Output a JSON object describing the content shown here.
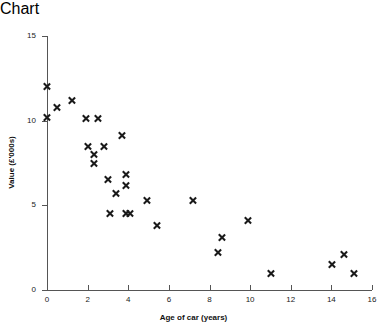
{
  "chart_data": {
    "type": "scatter",
    "title": "",
    "xlabel": "Age of car (years)",
    "ylabel": "Value (£'000s)",
    "xlim": [
      0,
      16
    ],
    "ylim": [
      0,
      15
    ],
    "xticks": [
      0,
      2,
      4,
      6,
      8,
      10,
      12,
      14,
      16
    ],
    "yticks": [
      0,
      5,
      10,
      15
    ],
    "grid": false,
    "legend": null,
    "marker": "x",
    "marker_color": "#1a1a1a",
    "points": [
      {
        "x": 0.0,
        "y": 12.0
      },
      {
        "x": 0.0,
        "y": 10.2
      },
      {
        "x": 0.5,
        "y": 10.8
      },
      {
        "x": 1.2,
        "y": 11.2
      },
      {
        "x": 1.9,
        "y": 10.1
      },
      {
        "x": 2.5,
        "y": 10.1
      },
      {
        "x": 2.0,
        "y": 8.5
      },
      {
        "x": 2.3,
        "y": 8.0
      },
      {
        "x": 2.3,
        "y": 7.5
      },
      {
        "x": 2.8,
        "y": 8.5
      },
      {
        "x": 3.7,
        "y": 9.1
      },
      {
        "x": 3.0,
        "y": 6.5
      },
      {
        "x": 3.9,
        "y": 6.8
      },
      {
        "x": 3.9,
        "y": 6.2
      },
      {
        "x": 3.4,
        "y": 5.7
      },
      {
        "x": 3.1,
        "y": 4.5
      },
      {
        "x": 3.9,
        "y": 4.5
      },
      {
        "x": 4.1,
        "y": 4.5
      },
      {
        "x": 4.9,
        "y": 5.3
      },
      {
        "x": 5.4,
        "y": 3.8
      },
      {
        "x": 7.2,
        "y": 5.3
      },
      {
        "x": 8.4,
        "y": 2.2
      },
      {
        "x": 8.6,
        "y": 3.1
      },
      {
        "x": 9.9,
        "y": 4.1
      },
      {
        "x": 11.0,
        "y": 1.0
      },
      {
        "x": 14.0,
        "y": 1.5
      },
      {
        "x": 14.6,
        "y": 2.1
      },
      {
        "x": 15.1,
        "y": 1.0
      }
    ]
  },
  "axes": {
    "x_title": "Age of car (years)",
    "y_title": "Value (£'000s)",
    "x_tick_labels": [
      "0",
      "2",
      "4",
      "6",
      "8",
      "10",
      "12",
      "14",
      "16"
    ],
    "y_tick_labels": [
      "0",
      "5",
      "10",
      "15"
    ]
  },
  "colors": {
    "marker": "#1a1a1a",
    "axis": "#555555",
    "background": "#ffffff",
    "text": "#222222"
  }
}
